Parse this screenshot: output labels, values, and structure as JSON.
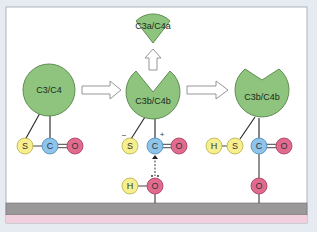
{
  "diagram": {
    "type": "complement thioester activation mechanism",
    "molecules": {
      "native": {
        "label": "C3/C4"
      },
      "cleaved_fragment": {
        "label": "C3a/C4a"
      },
      "activated": {
        "label": "C3b/C4b"
      },
      "bound": {
        "label": "C3b/C4b"
      }
    },
    "atoms": {
      "native": [
        {
          "symbol": "S"
        },
        {
          "symbol": "C"
        },
        {
          "symbol": "O"
        }
      ],
      "activated": [
        {
          "symbol": "S",
          "charge": "−"
        },
        {
          "symbol": "C",
          "charge": "+"
        },
        {
          "symbol": "O"
        }
      ],
      "attacking": [
        {
          "symbol": "H"
        },
        {
          "symbol": "O"
        }
      ],
      "bound": [
        {
          "symbol": "H"
        },
        {
          "symbol": "S"
        },
        {
          "symbol": "C"
        },
        {
          "symbol": "O"
        },
        {
          "symbol": "O"
        }
      ]
    },
    "colors": {
      "protein": "#8fc47e",
      "protein_stroke": "#5f8d52",
      "sulfur": "#f7ef8e",
      "hydrogen": "#f7ef8e",
      "carbon": "#8ec3ea",
      "oxygen": "#e06b8e",
      "membrane": "#9a9898",
      "membrane_lower": "#f2cfdc",
      "background": "#e6ebf2",
      "panel": "#ffffff"
    }
  }
}
